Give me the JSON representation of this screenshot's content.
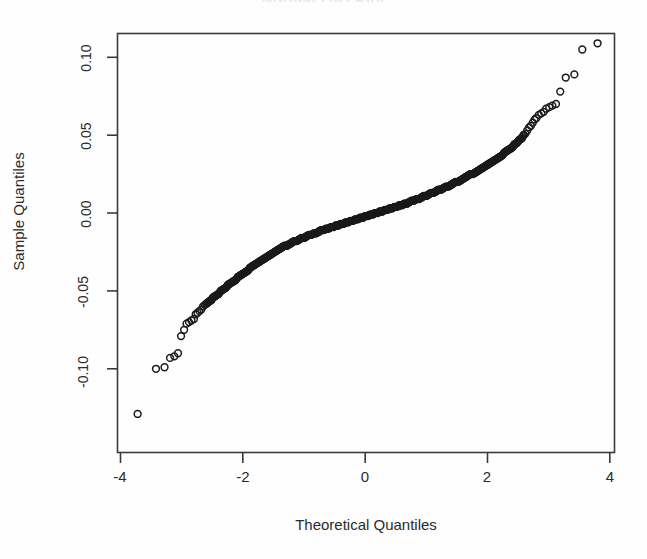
{
  "title": "Normal Q-Q Plot",
  "axes": {
    "xlabel": "Theoretical Quantiles",
    "ylabel": "Sample Quantiles",
    "xticks": [
      "-4",
      "-2",
      "0",
      "2",
      "4"
    ],
    "yticks": [
      "0.10",
      "0.05",
      "0.00",
      "-0.05",
      "-0.10"
    ]
  },
  "chart_data": {
    "type": "scatter",
    "title": "Normal Q-Q Plot",
    "xlabel": "Theoretical Quantiles",
    "ylabel": "Sample Quantiles",
    "xlim": [
      -4.1,
      4.1
    ],
    "ylim": [
      -0.138,
      0.122
    ],
    "xticks": [
      -4,
      -2,
      0,
      2,
      4
    ],
    "yticks": [
      -0.1,
      -0.05,
      0.0,
      0.05,
      0.1
    ],
    "grid": false,
    "legend": null,
    "marker": "open-circle",
    "marker_color": "#1a1a1a",
    "series": [
      {
        "name": "Sample vs Theoretical Quantiles",
        "x": [
          -3.72,
          -3.42,
          -3.28,
          -3.19,
          -3.12,
          -3.06,
          -3.01,
          -2.96,
          -2.92,
          -2.88,
          -2.84,
          -2.8,
          -2.77,
          -2.74,
          -2.71,
          -2.68,
          -2.65,
          -2.62,
          -2.59,
          -2.56,
          -2.52,
          -2.48,
          -2.44,
          -2.4,
          -2.36,
          -2.32,
          -2.28,
          -2.24,
          -2.2,
          -2.16,
          -2.12,
          -2.08,
          -2.04,
          -2.0,
          -1.96,
          -1.92,
          -1.88,
          -1.84,
          -1.8,
          -1.76,
          -1.72,
          -1.68,
          -1.64,
          -1.6,
          -1.56,
          -1.52,
          -1.48,
          -1.44,
          -1.4,
          -1.36,
          -1.32,
          -1.28,
          -1.24,
          -1.2,
          -1.16,
          -1.12,
          -1.08,
          -1.04,
          -1.0,
          -0.96,
          -0.92,
          -0.88,
          -0.84,
          -0.8,
          -0.76,
          -0.72,
          -0.68,
          -0.64,
          -0.6,
          -0.56,
          -0.52,
          -0.48,
          -0.44,
          -0.4,
          -0.36,
          -0.32,
          -0.28,
          -0.24,
          -0.2,
          -0.16,
          -0.12,
          -0.08,
          -0.04,
          0.0,
          0.04,
          0.08,
          0.12,
          0.16,
          0.2,
          0.24,
          0.28,
          0.32,
          0.36,
          0.4,
          0.44,
          0.48,
          0.52,
          0.56,
          0.6,
          0.64,
          0.68,
          0.72,
          0.76,
          0.8,
          0.84,
          0.88,
          0.92,
          0.96,
          1.0,
          1.04,
          1.08,
          1.12,
          1.16,
          1.2,
          1.24,
          1.28,
          1.32,
          1.36,
          1.4,
          1.44,
          1.48,
          1.52,
          1.56,
          1.6,
          1.64,
          1.68,
          1.72,
          1.76,
          1.8,
          1.84,
          1.88,
          1.92,
          1.96,
          2.0,
          2.04,
          2.08,
          2.12,
          2.16,
          2.2,
          2.24,
          2.28,
          2.32,
          2.36,
          2.4,
          2.44,
          2.48,
          2.52,
          2.56,
          2.59,
          2.62,
          2.65,
          2.68,
          2.71,
          2.74,
          2.77,
          2.8,
          2.84,
          2.88,
          2.92,
          2.96,
          3.01,
          3.06,
          3.12,
          3.19,
          3.28,
          3.42,
          3.55,
          3.8
        ],
        "y": [
          -0.129,
          -0.1,
          -0.099,
          -0.093,
          -0.092,
          -0.09,
          -0.079,
          -0.075,
          -0.071,
          -0.07,
          -0.069,
          -0.068,
          -0.065,
          -0.064,
          -0.063,
          -0.062,
          -0.06,
          -0.059,
          -0.058,
          -0.057,
          -0.056,
          -0.054,
          -0.053,
          -0.052,
          -0.05,
          -0.049,
          -0.048,
          -0.046,
          -0.045,
          -0.044,
          -0.043,
          -0.041,
          -0.04,
          -0.039,
          -0.038,
          -0.037,
          -0.035,
          -0.034,
          -0.033,
          -0.032,
          -0.031,
          -0.03,
          -0.029,
          -0.028,
          -0.027,
          -0.026,
          -0.025,
          -0.024,
          -0.023,
          -0.022,
          -0.021,
          -0.021,
          -0.02,
          -0.019,
          -0.018,
          -0.018,
          -0.017,
          -0.016,
          -0.016,
          -0.015,
          -0.014,
          -0.014,
          -0.013,
          -0.013,
          -0.012,
          -0.011,
          -0.011,
          -0.01,
          -0.01,
          -0.009,
          -0.009,
          -0.008,
          -0.008,
          -0.007,
          -0.007,
          -0.006,
          -0.006,
          -0.005,
          -0.005,
          -0.004,
          -0.004,
          -0.003,
          -0.003,
          -0.002,
          -0.002,
          -0.001,
          -0.001,
          0.0,
          0.0,
          0.001,
          0.001,
          0.002,
          0.002,
          0.003,
          0.003,
          0.004,
          0.004,
          0.005,
          0.005,
          0.006,
          0.006,
          0.007,
          0.008,
          0.008,
          0.009,
          0.009,
          0.01,
          0.011,
          0.011,
          0.012,
          0.013,
          0.013,
          0.014,
          0.015,
          0.015,
          0.016,
          0.017,
          0.017,
          0.018,
          0.019,
          0.02,
          0.02,
          0.021,
          0.022,
          0.023,
          0.024,
          0.025,
          0.025,
          0.026,
          0.027,
          0.028,
          0.029,
          0.03,
          0.031,
          0.032,
          0.033,
          0.034,
          0.035,
          0.036,
          0.037,
          0.039,
          0.04,
          0.041,
          0.042,
          0.044,
          0.045,
          0.047,
          0.048,
          0.05,
          0.051,
          0.053,
          0.055,
          0.056,
          0.058,
          0.06,
          0.061,
          0.063,
          0.064,
          0.065,
          0.067,
          0.068,
          0.069,
          0.07,
          0.078,
          0.087,
          0.089,
          0.105,
          0.109
        ]
      }
    ]
  }
}
